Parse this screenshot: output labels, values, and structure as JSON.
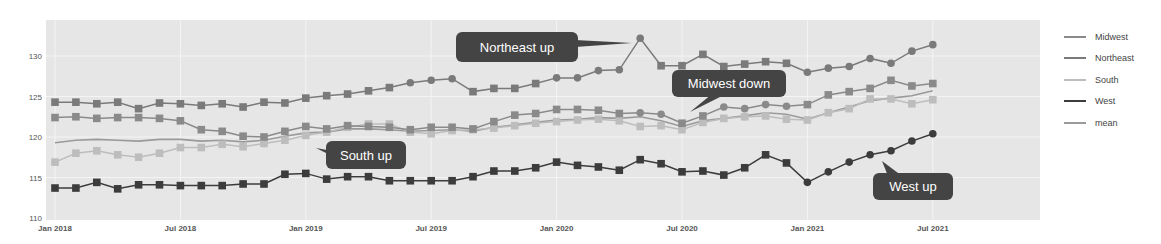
{
  "chart_data": {
    "type": "line",
    "title": "",
    "xlabel": "",
    "ylabel": "",
    "ylim": [
      110,
      134
    ],
    "grid": true,
    "legend_position": "right",
    "x_tick_labels": [
      "Jan 2018",
      "Jul 2018",
      "Jan 2019",
      "Jul 2019",
      "Jan 2020",
      "Jul 2020",
      "Jan 2021",
      "Jul 2021"
    ],
    "y_tick_labels": [
      "110",
      "115",
      "120",
      "125",
      "130"
    ],
    "y_ticks": [
      110,
      115,
      120,
      125,
      130
    ],
    "x_start": "Jan 2018",
    "x_end": "Jul 2021",
    "x_frequency": "monthly",
    "series": [
      {
        "name": "Midwest",
        "color": "#8a8a8a",
        "marker": "square",
        "values": [
          122.4,
          122.5,
          122.3,
          122.4,
          122.4,
          122.3,
          122.0,
          120.9,
          120.7,
          120.1,
          120.0,
          120.7,
          121.3,
          121.0,
          121.4,
          121.3,
          121.2,
          120.9,
          121.2,
          121.2,
          121.0,
          121.9,
          122.7,
          122.9,
          123.4,
          123.4,
          123.3,
          122.9,
          123.0,
          122.8,
          121.7,
          122.6,
          123.7,
          123.5,
          124.0,
          123.8,
          124.0,
          125.2,
          125.6,
          126.0,
          127.0,
          126.3,
          126.6
        ]
      },
      {
        "name": "Northeast",
        "color": "#7a7a7a",
        "marker": "square",
        "values": [
          124.3,
          124.3,
          124.1,
          124.3,
          123.5,
          124.2,
          124.1,
          123.9,
          124.1,
          123.7,
          124.3,
          124.2,
          124.8,
          125.1,
          125.3,
          125.7,
          126.1,
          126.7,
          127.0,
          127.2,
          125.6,
          126.0,
          126.0,
          126.6,
          127.3,
          127.3,
          128.2,
          128.3,
          132.2,
          128.8,
          128.8,
          130.2,
          128.7,
          129.0,
          129.3,
          129.1,
          128.0,
          128.5,
          128.7,
          129.7,
          129.1,
          130.6,
          131.4
        ]
      },
      {
        "name": "South",
        "color": "#bdbdbd",
        "marker": "square",
        "values": [
          116.9,
          118.0,
          118.3,
          117.8,
          117.5,
          118.0,
          118.7,
          118.7,
          119.1,
          118.8,
          119.2,
          119.6,
          120.2,
          120.6,
          121.2,
          121.6,
          121.6,
          120.6,
          120.4,
          120.8,
          120.9,
          121.1,
          121.4,
          121.7,
          121.9,
          122.1,
          122.2,
          122.0,
          121.3,
          121.4,
          120.9,
          121.8,
          122.3,
          122.5,
          122.6,
          122.2,
          122.1,
          123.0,
          123.5,
          124.7,
          124.7,
          124.1,
          124.6
        ]
      },
      {
        "name": "West",
        "color": "#3c3c3c",
        "marker": "square",
        "values": [
          113.7,
          113.7,
          114.4,
          113.6,
          114.1,
          114.1,
          114.0,
          114.0,
          114.0,
          114.2,
          114.2,
          115.4,
          115.5,
          114.8,
          115.1,
          115.1,
          114.6,
          114.6,
          114.6,
          114.6,
          115.1,
          115.8,
          115.8,
          116.2,
          116.9,
          116.5,
          116.3,
          115.9,
          117.2,
          116.7,
          115.7,
          115.8,
          115.3,
          116.2,
          117.8,
          116.8,
          114.4,
          115.7,
          116.9,
          117.8,
          118.3,
          119.5,
          120.4
        ]
      },
      {
        "name": "mean",
        "color": "#9a9a9a",
        "marker": "none",
        "values": [
          119.3,
          119.6,
          119.7,
          119.6,
          119.5,
          119.7,
          119.7,
          119.5,
          119.6,
          119.4,
          119.6,
          120.1,
          120.5,
          120.6,
          121.0,
          121.0,
          120.9,
          120.7,
          120.8,
          120.9,
          120.7,
          121.2,
          121.5,
          121.8,
          122.1,
          122.2,
          122.4,
          122.3,
          122.5,
          122.0,
          121.3,
          122.0,
          122.3,
          122.6,
          123.0,
          122.8,
          122.2,
          123.0,
          123.7,
          124.5,
          124.8,
          125.1,
          125.7
        ]
      }
    ],
    "annotations": [
      {
        "text": "Northeast up",
        "series": "Northeast",
        "point_index": 28
      },
      {
        "text": "Midwest down",
        "series": "Midwest",
        "point_index": 30
      },
      {
        "text": "South up",
        "series": "South",
        "point_index": 12
      },
      {
        "text": "West up",
        "series": "West",
        "point_index": 40
      }
    ]
  },
  "legend": {
    "items": [
      {
        "label": "Midwest",
        "color": "#8a8a8a"
      },
      {
        "label": "Northeast",
        "color": "#7a7a7a"
      },
      {
        "label": "South",
        "color": "#bdbdbd"
      },
      {
        "label": "West",
        "color": "#3c3c3c"
      },
      {
        "label": "mean",
        "color": "#9a9a9a"
      }
    ]
  },
  "callouts": [
    {
      "label": "Northeast up"
    },
    {
      "label": "Midwest down"
    },
    {
      "label": "South up"
    },
    {
      "label": "West up"
    }
  ],
  "style": {
    "plot_bg": "#e6e6e6",
    "grid_color": "#f4f4f4",
    "callout_bg": "#444444",
    "callout_text": "#ffffff",
    "tick_text": "#555555"
  }
}
